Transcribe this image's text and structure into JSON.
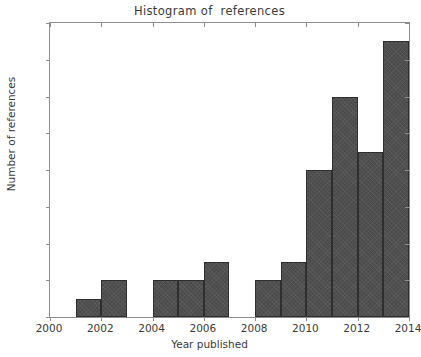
{
  "chart_data": {
    "type": "bar",
    "title": "Histogram of  references",
    "xlabel": "Year published",
    "ylabel": "Number of references",
    "categories": [
      2000,
      2001,
      2002,
      2003,
      2004,
      2005,
      2006,
      2007,
      2008,
      2009,
      2010,
      2011,
      2012,
      2013
    ],
    "values": [
      0,
      1,
      2,
      0,
      2,
      2,
      3,
      0,
      2,
      3,
      8,
      12,
      9,
      15
    ],
    "bins": [
      {
        "year": 2000,
        "count": 0
      },
      {
        "year": 2001,
        "count": 1
      },
      {
        "year": 2002,
        "count": 2
      },
      {
        "year": 2003,
        "count": 0
      },
      {
        "year": 2004,
        "count": 2
      },
      {
        "year": 2005,
        "count": 2
      },
      {
        "year": 2006,
        "count": 3
      },
      {
        "year": 2007,
        "count": 0
      },
      {
        "year": 2008,
        "count": 2
      },
      {
        "year": 2009,
        "count": 3
      },
      {
        "year": 2010,
        "count": 8
      },
      {
        "year": 2011,
        "count": 12
      },
      {
        "year": 2012,
        "count": 9
      },
      {
        "year": 2013,
        "count": 15
      }
    ],
    "xlim": [
      2000,
      2014
    ],
    "ylim": [
      0,
      16
    ],
    "xticks": [
      2000,
      2002,
      2004,
      2006,
      2008,
      2010,
      2012,
      2014
    ],
    "xtick_labels": [
      "2000",
      "2002",
      "2004",
      "2006",
      "2008",
      "2010",
      "2012",
      "2014"
    ],
    "yticks": [
      0,
      2,
      4,
      6,
      8,
      10,
      12,
      14,
      16
    ],
    "ytick_labels": [
      "0",
      "2",
      "4",
      "6",
      "8",
      "10",
      "12",
      "14",
      "16"
    ],
    "grid": false,
    "legend": null,
    "bar_color": "#4b4b4b",
    "bar_edge_color": "#2e2e2e",
    "axes_color": "#8d8d8d",
    "text_color": "#3a3a3a",
    "background_color": "#ffffff",
    "bar_width_years": 1
  }
}
